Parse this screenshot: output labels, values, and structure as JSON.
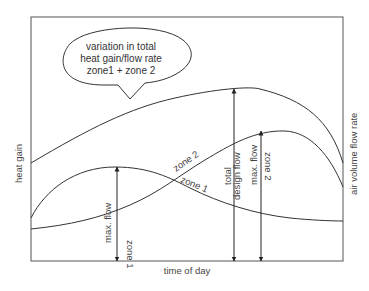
{
  "diagram": {
    "type": "line-diagram",
    "title": "",
    "x_axis_label": "time of day",
    "y_axis_left_label": "heat gain",
    "y_axis_right_label": "air volume flow rate",
    "callout": {
      "lines": [
        "variation in total",
        "heat gain/flow rate",
        "zone1 + zone 2"
      ]
    },
    "curves": [
      {
        "name": "total",
        "description": "total heat gain / flow rate (zone 1 + zone 2)"
      },
      {
        "name": "zone 1",
        "label": "zone 1"
      },
      {
        "name": "zone 2",
        "label": "zone 2"
      }
    ],
    "arrows": [
      {
        "name": "max-flow-zone-1",
        "lines": [
          "max. flow",
          "zone 1"
        ]
      },
      {
        "name": "total-design-flow",
        "lines": [
          "total",
          "design flow"
        ]
      },
      {
        "name": "max-flow-zone-2",
        "lines": [
          "max. flow",
          "zone 2"
        ]
      }
    ],
    "caption": ""
  },
  "colors": {
    "line": "#333333",
    "frame": "#555555",
    "text": "#444444",
    "background": "#ffffff"
  }
}
